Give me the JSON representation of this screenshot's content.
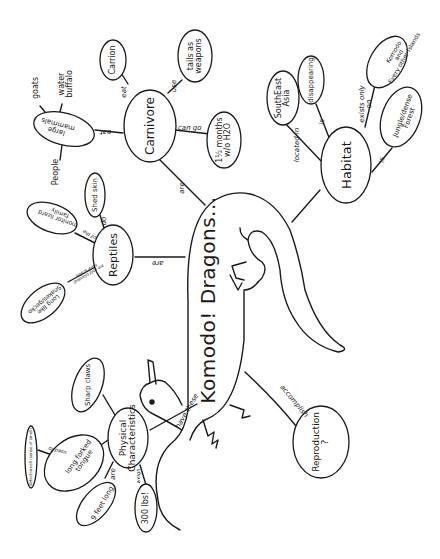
{
  "title": "Komodo! Dragons...",
  "central_topic": {
    "label": "Komodo! Dragons...",
    "shape": "dragon-drawing"
  },
  "nodes": {
    "carnivore": {
      "label": "Carnivore",
      "link_from_center": "are",
      "children": [
        {
          "link": "eat",
          "label": "Carrion"
        },
        {
          "link": "use",
          "label": "tails as\nweapons"
        },
        {
          "link": "can go",
          "label": "1½ months\nw/o H2O"
        },
        {
          "link": "eat",
          "label": "large\nmammals",
          "children": [
            {
              "link": "e.g.",
              "label": "goats"
            },
            {
              "link": "e.g.",
              "label": "water\nbuffalo"
            },
            {
              "link": "even",
              "label": "People"
            }
          ]
        }
      ]
    },
    "habitat": {
      "label": "Habitat",
      "children": [
        {
          "link": "located in",
          "label": "SouthEast\nAsia"
        },
        {
          "link": "is",
          "label": "disappearing"
        },
        {
          "link": "exists only\non",
          "label": "Komodo\nand\nEvery other Islands"
        },
        {
          "link": "is",
          "label": "Jungle/dense\nForest"
        }
      ]
    },
    "reptiles": {
      "label": "Reptiles",
      "link_from_center": "are",
      "children": [
        {
          "link": "do",
          "label": "Shed skin"
        },
        {
          "link": "of the",
          "label": "monitor lizard\nfamily"
        },
        {
          "link": "are cold blooded/\nhave scales",
          "label": "Long like\nSnakes/gecko"
        }
      ]
    },
    "physical": {
      "label": "Physical\nCharacteristics",
      "link_from_center": "have these",
      "children": [
        {
          "link": "",
          "label": "Sharp claws"
        },
        {
          "link": "",
          "label": "long forked\ntongue",
          "children": [
            {
              "link": "used to",
              "label": "detect/smell (sense of smell)"
            }
          ]
        },
        {
          "link": "are",
          "label": "9 feet long"
        },
        {
          "link": "weigh",
          "label": "300 lbs!"
        }
      ]
    },
    "reproduction": {
      "label": "Reproduction\n?",
      "link_from_center": "accomplish"
    }
  },
  "colors": {
    "ink": "#1a1a1a",
    "paper": "#ffffff"
  }
}
